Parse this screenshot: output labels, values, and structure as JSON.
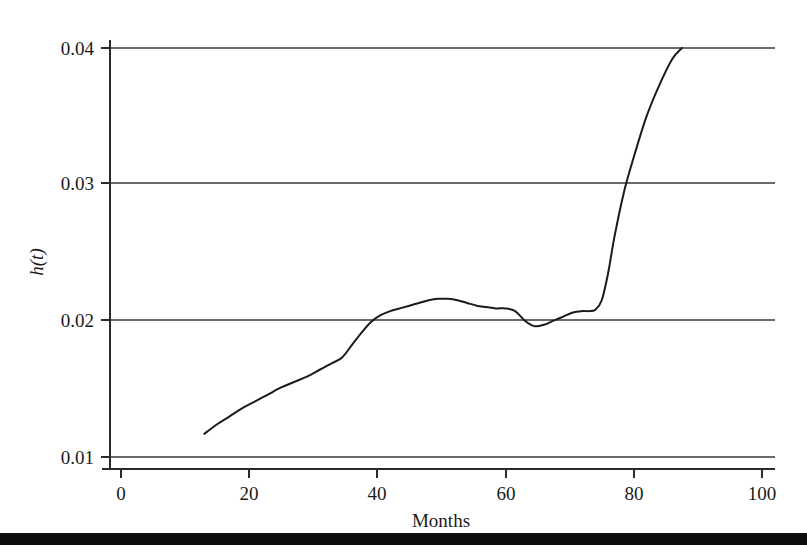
{
  "figure": {
    "background_color": "#ffffff",
    "curve_color": "#1b1b1b",
    "gridline_color": "#6b6b6b",
    "axis_color": "#2a2a2a",
    "footer_rule_color": "#0d0d0d"
  },
  "chart_data": {
    "type": "line",
    "title": "",
    "subtitle": "",
    "xlabel": "Months",
    "ylabel": "h(t)",
    "xlim": [
      0,
      100
    ],
    "ylim": [
      0.01,
      0.04
    ],
    "xticks": [
      0,
      20,
      40,
      60,
      80,
      100
    ],
    "xticklabels": [
      "0",
      "20",
      "40",
      "60",
      "80",
      "100"
    ],
    "yticks": [
      0.01,
      0.02,
      0.03,
      0.04
    ],
    "yticklabels": [
      "0.01",
      "0.02",
      "0.03",
      "0.04"
    ],
    "grid": "horizontal",
    "legend": "none",
    "annotations": [],
    "series": [
      {
        "name": "h(t)",
        "color": "#1b1b1b",
        "x": [
          13.0,
          15.0,
          17.0,
          19.0,
          21.0,
          23.0,
          25.0,
          27.0,
          29.0,
          31.0,
          33.0,
          34.5,
          36.0,
          37.5,
          39.0,
          40.5,
          42.0,
          43.5,
          45.0,
          46.5,
          48.0,
          49.5,
          51.0,
          52.5,
          54.0,
          55.5,
          57.0,
          58.5,
          60.0,
          61.5,
          63.0,
          64.5,
          66.0,
          67.5,
          69.0,
          70.5,
          72.0,
          73.0,
          74.0,
          75.0,
          76.0,
          77.0,
          78.5,
          80.0,
          82.0,
          84.0,
          86.0,
          87.5
        ],
        "y": [
          0.0117,
          0.0124,
          0.013,
          0.0136,
          0.0141,
          0.0146,
          0.0151,
          0.0155,
          0.0159,
          0.0164,
          0.0169,
          0.0173,
          0.0182,
          0.0191,
          0.0199,
          0.0204,
          0.0207,
          0.0209,
          0.0211,
          0.0213,
          0.0215,
          0.0216,
          0.0216,
          0.0215,
          0.0213,
          0.0211,
          0.021,
          0.0209,
          0.0209,
          0.0207,
          0.02,
          0.0196,
          0.0197,
          0.02,
          0.0203,
          0.0206,
          0.0207,
          0.0207,
          0.0208,
          0.0215,
          0.0235,
          0.0262,
          0.0295,
          0.032,
          0.035,
          0.0373,
          0.0392,
          0.04
        ]
      }
    ]
  },
  "axes": {
    "y_axis_label": "h(t)",
    "x_axis_label": "Months",
    "y_tick_0": "0.01",
    "y_tick_1": "0.02",
    "y_tick_2": "0.03",
    "y_tick_3": "0.04",
    "x_tick_0": "0",
    "x_tick_1": "20",
    "x_tick_2": "40",
    "x_tick_3": "60",
    "x_tick_4": "80",
    "x_tick_5": "100"
  }
}
